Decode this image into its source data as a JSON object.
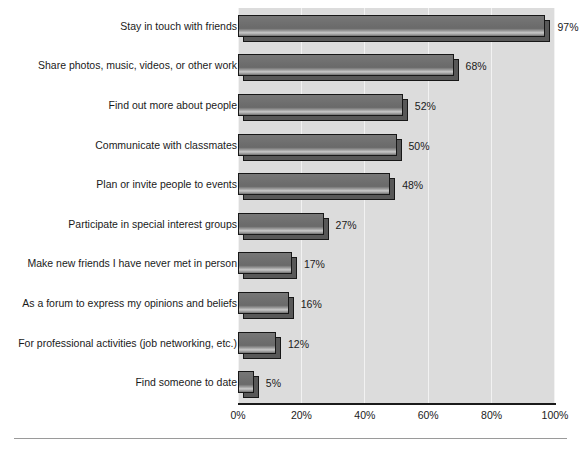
{
  "chart_data": {
    "type": "bar",
    "orientation": "horizontal",
    "title": "",
    "subtitle": "",
    "xlabel": "",
    "ylabel": "",
    "xlim": [
      0,
      100
    ],
    "grid": true,
    "legend": false,
    "legend_position": "none",
    "xtick_labels": [
      "0%",
      "20%",
      "40%",
      "60%",
      "80%",
      "100%"
    ],
    "xticks": [
      0,
      20,
      40,
      60,
      80,
      100
    ],
    "categories": [
      "Stay in touch with friends",
      "Share photos, music, videos, or other work",
      "Find out more about people",
      "Communicate with classmates",
      "Plan or invite people to events",
      "Participate in special interest groups",
      "Make new friends I have never met in person",
      "As a forum to express my opinions and beliefs",
      "For professional activities (job networking, etc.)",
      "Find someone to date"
    ],
    "values": [
      97,
      68,
      52,
      50,
      48,
      27,
      17,
      16,
      12,
      5
    ],
    "value_labels": [
      "97%",
      "68%",
      "52%",
      "50%",
      "48%",
      "27%",
      "17%",
      "16%",
      "12%",
      "5%"
    ],
    "colors": {
      "bar_fill": "#6d6d6d",
      "bar_outline": "#171717",
      "bar_shadow": "#585858",
      "plot_background": "#dcdcdc",
      "gridline": "#f2f2f2",
      "axis_line": "#1a1a1a",
      "text": "#1a1a1a",
      "page_background": "#ffffff",
      "footer_rule": "#9a9a9a"
    }
  }
}
